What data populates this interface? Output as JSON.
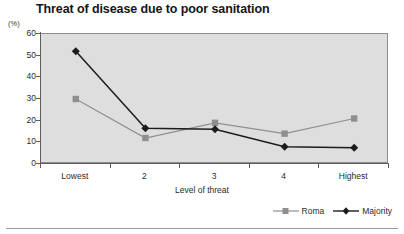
{
  "chart_data": {
    "type": "line",
    "title": "Threat of disease due to poor sanitation",
    "unit_label": "(%)",
    "xlabel": "Level of threat",
    "ylabel": "",
    "categories": [
      "Lowest",
      "2",
      "3",
      "4",
      "Highest"
    ],
    "ylim": [
      0,
      60
    ],
    "yticks": [
      0,
      10,
      20,
      30,
      40,
      50,
      60
    ],
    "grid": false,
    "legend_position": "bottom-right",
    "series": [
      {
        "name": "Roma",
        "values": [
          30,
          12,
          19,
          14,
          21
        ],
        "color": "#8f8f8f",
        "marker": "square"
      },
      {
        "name": "Majority",
        "values": [
          52,
          16.5,
          16,
          8,
          7.5
        ],
        "color": "#1c1c1c",
        "marker": "diamond"
      }
    ]
  },
  "colors": {
    "plot_background": "#dedede",
    "plot_border": "#8d8d8d",
    "axis": "#5d5d5d",
    "page_background": "#ffffff"
  }
}
